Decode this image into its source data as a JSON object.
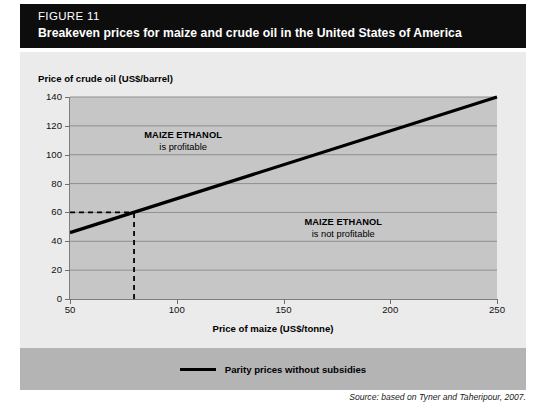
{
  "figure": {
    "number_label": "FIGURE 11",
    "title": "Breakeven prices for maize and crude oil in the United States of America",
    "source": "Source: based on Tyner and Taheripour, 2007.",
    "header_bg": "#0d0d0d",
    "panel_bg": "#ebebeb",
    "plot_bg": "#c6c6c6",
    "legend_bg": "#b4b4b4",
    "line_color": "#000000"
  },
  "legend": {
    "items": [
      {
        "label": "Parity prices without subsidies",
        "color": "#000000",
        "style": "solid"
      }
    ]
  },
  "chart_data": {
    "type": "line",
    "title": "Breakeven prices for maize and crude oil in the United States of America",
    "xlabel": "Price of maize (US$/tonne)",
    "ylabel": "Price of crude oil (US$/barrel)",
    "xlim": [
      50,
      250
    ],
    "ylim": [
      0,
      140
    ],
    "xticks": [
      50,
      100,
      150,
      200,
      250
    ],
    "yticks": [
      0,
      20,
      40,
      60,
      80,
      100,
      120,
      140
    ],
    "grid": "horizontal",
    "legend_position": "bottom",
    "series": [
      {
        "name": "Parity prices without subsidies",
        "color": "#000000",
        "x": [
          50,
          250
        ],
        "values": [
          46,
          140
        ]
      }
    ],
    "guides": [
      {
        "name": "breakeven-horizontal",
        "axis": "y",
        "value": 60,
        "style": "dashed",
        "from_x": 50,
        "to_x": 80
      },
      {
        "name": "breakeven-vertical",
        "axis": "x",
        "value": 80,
        "style": "dashed",
        "from_y": 0,
        "to_y": 60
      }
    ],
    "annotations": [
      {
        "line1": "MAIZE ETHANOL",
        "line2": "is profitable",
        "x": 103,
        "y": 113
      },
      {
        "line1": "MAIZE ETHANOL",
        "line2": "is not profitable",
        "x": 178,
        "y": 53
      }
    ]
  }
}
